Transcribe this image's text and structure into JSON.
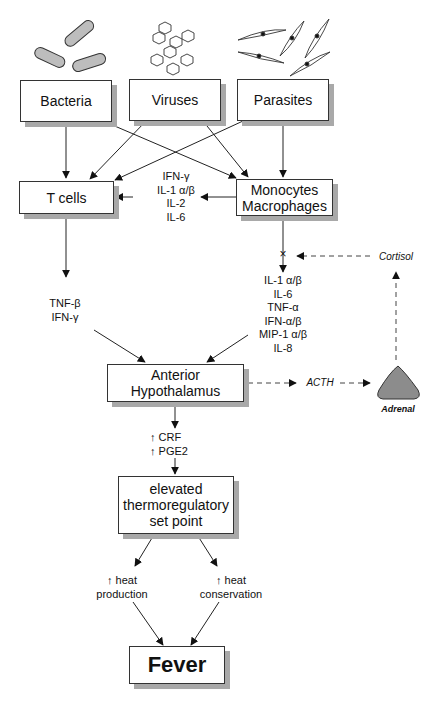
{
  "diagram": {
    "pathogens": {
      "bacteria": "Bacteria",
      "viruses": "Viruses",
      "parasites": "Parasites"
    },
    "cells": {
      "t_cells": "T cells",
      "monocytes_macrophages": "Monocytes\nMacrophages"
    },
    "cytokines_mono_to_t": "IFN-γ\nIL-1 α/β\nIL-2\nIL-6",
    "cytokines_t_cells": "TNF-β\nIFN-γ",
    "cytokines_monocytes": "IL-1 α/β\nIL-6\nTNF-α\nIFN-α/β\nMIP-1 α/β\nIL-8",
    "cortisol": "Cortisol",
    "inhibition_mark": "×",
    "anterior_hypothalamus": "Anterior\nHypothalamus",
    "acth": "ACTH",
    "adrenal": "Adrenal",
    "hypothalamic_mediators": "↑ CRF\n↑ PGE2",
    "set_point": "elevated\nthermoregulatory\nset point",
    "heat_production": "↑ heat\nproduction",
    "heat_conservation": "↑ heat\nconservation",
    "outcome": "Fever"
  },
  "colors": {
    "line": "#222222",
    "box_border": "#333333",
    "shadow": "#a9a9a9",
    "bacteria_fill": "#bdbdbd",
    "adrenal_fill": "#8c8c8c"
  }
}
